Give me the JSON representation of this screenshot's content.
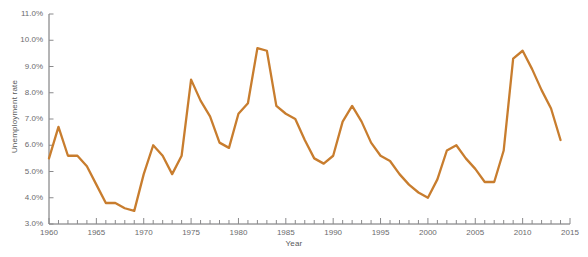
{
  "chart_data": {
    "type": "line",
    "title": "",
    "xlabel": "Year",
    "ylabel": "Unemployment rate",
    "xlim": [
      1960,
      2015
    ],
    "ylim": [
      3.0,
      11.0
    ],
    "grid": false,
    "legend": null,
    "line_color": "#c87d2e",
    "axis_color": "#6b6b6d",
    "tick_color": "#8a8a8c",
    "background": "#ffffff",
    "y_tick_labels": [
      "3.0%",
      "4.0%",
      "5.0%",
      "6.0%",
      "7.0%",
      "8.0%",
      "9.0%",
      "10.0%",
      "11.0%"
    ],
    "y_tick_values": [
      3.0,
      4.0,
      5.0,
      6.0,
      7.0,
      8.0,
      9.0,
      10.0,
      11.0
    ],
    "x_tick_labels": [
      "1960",
      "1965",
      "1970",
      "1975",
      "1980",
      "1985",
      "1990",
      "1995",
      "2000",
      "2005",
      "2010",
      "2015"
    ],
    "x_tick_values": [
      1960,
      1965,
      1970,
      1975,
      1980,
      1985,
      1990,
      1995,
      2000,
      2005,
      2010,
      2015
    ],
    "x_minor_step": 1,
    "series": [
      {
        "name": "Unemployment rate",
        "x": [
          1960,
          1961,
          1962,
          1963,
          1964,
          1965,
          1966,
          1967,
          1968,
          1969,
          1970,
          1971,
          1972,
          1973,
          1974,
          1975,
          1976,
          1977,
          1978,
          1979,
          1980,
          1981,
          1982,
          1983,
          1984,
          1985,
          1986,
          1987,
          1988,
          1989,
          1990,
          1991,
          1992,
          1993,
          1994,
          1995,
          1996,
          1997,
          1998,
          1999,
          2000,
          2001,
          2002,
          2003,
          2004,
          2005,
          2006,
          2007,
          2008,
          2009,
          2010,
          2011,
          2012,
          2013,
          2014
        ],
        "values": [
          5.5,
          6.7,
          5.6,
          5.6,
          5.2,
          4.5,
          3.8,
          3.8,
          3.6,
          3.5,
          4.9,
          6.0,
          5.6,
          4.9,
          5.6,
          8.5,
          7.7,
          7.1,
          6.1,
          5.9,
          7.2,
          7.6,
          9.7,
          9.6,
          7.5,
          7.2,
          7.0,
          6.2,
          5.5,
          5.3,
          5.6,
          6.9,
          7.5,
          6.9,
          6.1,
          5.6,
          5.4,
          4.9,
          4.5,
          4.2,
          4.0,
          4.7,
          5.8,
          6.0,
          5.5,
          5.1,
          4.6,
          4.6,
          5.8,
          9.3,
          9.6,
          8.9,
          8.1,
          7.4,
          6.2
        ]
      }
    ],
    "annotations": []
  }
}
